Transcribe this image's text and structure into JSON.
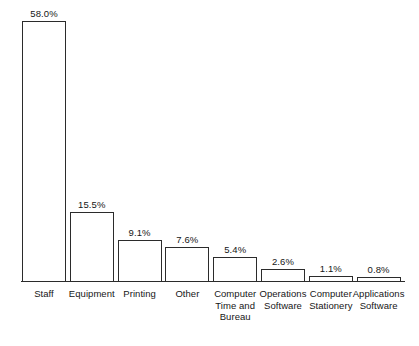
{
  "chart_data": {
    "type": "bar",
    "title": "",
    "subtitle": "",
    "xlabel": "",
    "ylabel": "",
    "ylim": [
      0,
      58.0
    ],
    "grid": false,
    "legend": false,
    "value_suffix": "%",
    "axis": {
      "baseline_visible": true,
      "y_axis_visible": false,
      "tick_marks": false
    },
    "categories": [
      "Staff",
      "Equipment",
      "Printing",
      "Other",
      "Computer\nTime and\nBureau",
      "Operations\nSoftware",
      "Computer\nStationery",
      "Applications\nSoftware"
    ],
    "values": [
      58.0,
      15.5,
      9.1,
      7.6,
      5.4,
      2.6,
      1.1,
      0.8
    ],
    "value_labels": [
      "58.0%",
      "15.5%",
      "9.1%",
      "7.6%",
      "5.4%",
      "2.6%",
      "1.1%",
      "0.8%"
    ],
    "style": {
      "bar_fill": "#ffffff",
      "bar_stroke": "#2b2b2b",
      "text_color": "#161616",
      "background": "#ffffff"
    }
  }
}
